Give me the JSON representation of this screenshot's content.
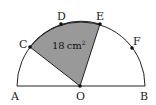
{
  "diagram": {
    "type": "semicircle-sector",
    "center": "O",
    "diameter_endpoints": [
      "A",
      "B"
    ],
    "arc_points": [
      "C",
      "D",
      "E",
      "F"
    ],
    "shaded_sector": [
      "C",
      "O",
      "E"
    ],
    "labels": {
      "A": "A",
      "B": "B",
      "O": "O",
      "C": "C",
      "D": "D",
      "E": "E",
      "F": "F"
    },
    "shaded_area": {
      "value": "18",
      "unit": "cm",
      "exponent": "2"
    },
    "colors": {
      "shade": "#999999",
      "stroke": "#222222"
    }
  }
}
